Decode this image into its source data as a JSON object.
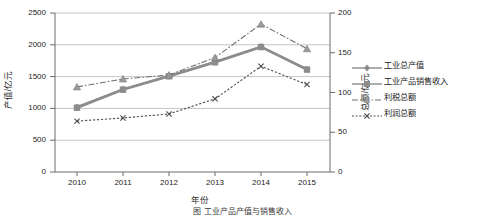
{
  "chart_data": {
    "type": "line",
    "title": "",
    "xlabel": "年份",
    "ylabel": "产值/亿元",
    "ylabel_secondary": "总额/亿元",
    "categories": [
      "2010",
      "2011",
      "2012",
      "2013",
      "2014",
      "2015"
    ],
    "x": [
      2010,
      2011,
      2012,
      2013,
      2014,
      2015
    ],
    "ylim": [
      0,
      2500
    ],
    "ylim_secondary": [
      0,
      200
    ],
    "yticks": [
      0,
      500,
      1000,
      1500,
      2000,
      2500
    ],
    "yticks_secondary": [
      0,
      50,
      100,
      150,
      200
    ],
    "grid": true,
    "legend_position": "right",
    "series": [
      {
        "name": "工业总产值",
        "axis": "left",
        "marker": "diamond",
        "linestyle": "solid",
        "color": "#8c8c8c",
        "values": [
          1020,
          1300,
          1510,
          1730,
          1970,
          1615
        ]
      },
      {
        "name": "工业产品销售收入",
        "axis": "left",
        "marker": "square",
        "linestyle": "solid",
        "color": "#8c8c8c",
        "values": [
          1010,
          1295,
          1505,
          1725,
          1965,
          1610
        ]
      },
      {
        "name": "利税总额",
        "axis": "right",
        "marker": "triangle",
        "linestyle": "dashdot",
        "color": "#6e6e6e",
        "values": [
          107,
          117,
          122,
          144,
          186,
          155
        ]
      },
      {
        "name": "利润总额",
        "axis": "right",
        "marker": "x",
        "linestyle": "dotted",
        "color": "#4d4d4d",
        "values": [
          64,
          68,
          73,
          92,
          133,
          110
        ]
      }
    ]
  },
  "axes": {
    "left_title": "产值/亿元",
    "right_title": "总额/亿元",
    "x_title": "年份",
    "left_ticks": [
      "2500",
      "2000",
      "1500",
      "1000",
      "500",
      "0"
    ],
    "right_ticks": [
      "200",
      "150",
      "100",
      "50",
      "0"
    ],
    "x_ticks": [
      "2010",
      "2011",
      "2012",
      "2013",
      "2014",
      "2015"
    ]
  },
  "legend": {
    "items": [
      {
        "label": "工业总产值",
        "marker": "diamond-marker-icon",
        "style": "solid"
      },
      {
        "label": "工业产品销售收入",
        "marker": "square-marker-icon",
        "style": "solid"
      },
      {
        "label": "利税总额",
        "marker": "triangle-marker-icon",
        "style": "dashdot"
      },
      {
        "label": "利润总额",
        "marker": "x-marker-icon",
        "style": "dotted"
      }
    ]
  },
  "caption": {
    "text": "图  工业产品产值与销售收入"
  },
  "colors": {
    "series_gray": "#8c8c8c",
    "grid": "#b5b5b5",
    "axis": "#6b6b6b",
    "text": "#1a1a1a"
  }
}
